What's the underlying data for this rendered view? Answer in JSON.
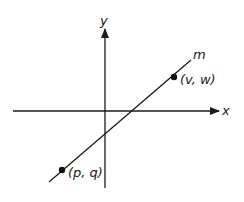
{
  "diagram": {
    "type": "coordinate-plane",
    "axes": {
      "x_label": "x",
      "y_label": "y"
    },
    "line": {
      "label": "m"
    },
    "points": [
      {
        "name": "point-vw",
        "label": "(v, w)"
      },
      {
        "name": "point-pq",
        "label": "(p, q)"
      }
    ],
    "colors": {
      "stroke": "#1a1a1a",
      "background": "#ffffff"
    }
  }
}
